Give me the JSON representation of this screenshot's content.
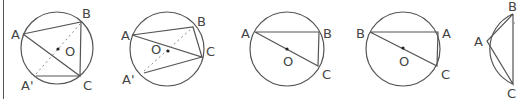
{
  "figures": [
    {
      "id": "fig1",
      "labels": {
        "A": "A",
        "B": "B",
        "C": "C",
        "A2": "A'",
        "O": "O"
      },
      "center": [
        57,
        48
      ],
      "radius": 36,
      "points": {
        "A": [
          23,
          34
        ],
        "B": [
          81,
          22
        ],
        "C": [
          80,
          76
        ],
        "A2": [
          36,
          76
        ],
        "O": [
          58,
          49
        ]
      }
    },
    {
      "id": "fig2",
      "labels": {
        "A": "A",
        "B": "B",
        "C": "C",
        "A2": "A'",
        "O": "O"
      },
      "center": [
        167,
        49
      ],
      "radius": 37,
      "points": {
        "A": [
          132,
          35
        ],
        "B": [
          193,
          27
        ],
        "C": [
          202,
          57
        ],
        "A2": [
          144,
          73
        ],
        "O": [
          168,
          51
        ]
      }
    },
    {
      "id": "fig3",
      "labels": {
        "A": "A",
        "B": "B",
        "C": "C",
        "O": "O"
      },
      "center": [
        287,
        49
      ],
      "radius": 37,
      "points": {
        "A": [
          255,
          32
        ],
        "B": [
          319,
          32
        ],
        "C": [
          318,
          66
        ],
        "O": [
          287,
          49
        ]
      }
    },
    {
      "id": "fig4",
      "labels": {
        "B": "B",
        "A": "A",
        "C": "C",
        "O": "O"
      },
      "center": [
        403,
        49
      ],
      "radius": 37,
      "points": {
        "B": [
          370,
          32
        ],
        "A": [
          438,
          32
        ],
        "C": [
          437,
          66
        ],
        "O": [
          403,
          48
        ]
      }
    },
    {
      "id": "fig5",
      "labels": {
        "A": "A",
        "B": "B",
        "C": "C"
      },
      "points": {
        "B": [
          513,
          14
        ],
        "A": [
          487,
          41
        ],
        "C": [
          513,
          84
        ]
      }
    }
  ]
}
